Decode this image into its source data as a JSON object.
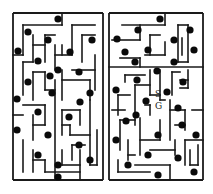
{
  "figure": {
    "colors": {
      "wall": "#1a1a1a",
      "dot": "#0a0a0a",
      "background": "#ffffff"
    }
  },
  "mazes": [
    {
      "id": "left",
      "bounds": [
        13,
        13,
        103,
        180
      ],
      "walls": [
        [
          13,
          13,
          103,
          13
        ],
        [
          103,
          13,
          103,
          180
        ],
        [
          13,
          180,
          103,
          180
        ],
        [
          13,
          13,
          13,
          180
        ],
        [
          23,
          25,
          62,
          25
        ],
        [
          62,
          25,
          62,
          13
        ],
        [
          23,
          25,
          23,
          55
        ],
        [
          13,
          55,
          23,
          55
        ],
        [
          33,
          35,
          33,
          62
        ],
        [
          33,
          45,
          45,
          45
        ],
        [
          45,
          35,
          45,
          62
        ],
        [
          45,
          35,
          55,
          35
        ],
        [
          55,
          45,
          55,
          70
        ],
        [
          55,
          55,
          72,
          55
        ],
        [
          72,
          25,
          72,
          55
        ],
        [
          72,
          25,
          95,
          25
        ],
        [
          82,
          35,
          82,
          62
        ],
        [
          82,
          35,
          95,
          35
        ],
        [
          62,
          45,
          62,
          55
        ],
        [
          23,
          62,
          33,
          62
        ],
        [
          23,
          62,
          23,
          95
        ],
        [
          33,
          72,
          33,
          100
        ],
        [
          33,
          72,
          45,
          72
        ],
        [
          45,
          72,
          45,
          90
        ],
        [
          45,
          90,
          55,
          90
        ],
        [
          55,
          80,
          55,
          180
        ],
        [
          62,
          70,
          62,
          100
        ],
        [
          62,
          80,
          90,
          80
        ],
        [
          90,
          80,
          90,
          100
        ],
        [
          72,
          70,
          95,
          70
        ],
        [
          95,
          55,
          95,
          90
        ],
        [
          23,
          105,
          45,
          105
        ],
        [
          45,
          105,
          45,
          125
        ],
        [
          13,
          115,
          23,
          115
        ],
        [
          33,
          115,
          33,
          140
        ],
        [
          33,
          125,
          45,
          125
        ],
        [
          62,
          110,
          80,
          110
        ],
        [
          80,
          110,
          80,
          125
        ],
        [
          62,
          110,
          62,
          135
        ],
        [
          62,
          125,
          70,
          125
        ],
        [
          70,
          125,
          70,
          135
        ],
        [
          70,
          135,
          90,
          135
        ],
        [
          90,
          100,
          90,
          165
        ],
        [
          90,
          165,
          97,
          165
        ],
        [
          97,
          130,
          97,
          165
        ],
        [
          72,
          145,
          72,
          160
        ],
        [
          72,
          145,
          85,
          145
        ],
        [
          23,
          140,
          23,
          172
        ],
        [
          33,
          150,
          33,
          172
        ],
        [
          33,
          160,
          45,
          160
        ],
        [
          45,
          160,
          45,
          172
        ],
        [
          45,
          172,
          80,
          172
        ],
        [
          62,
          150,
          62,
          165
        ],
        [
          62,
          165,
          80,
          165
        ],
        [
          80,
          150,
          80,
          180
        ]
      ],
      "dots": [
        [
          58,
          19
        ],
        [
          28,
          32
        ],
        [
          48,
          40
        ],
        [
          92,
          40
        ],
        [
          18,
          51
        ],
        [
          70,
          52
        ],
        [
          38,
          61
        ],
        [
          58,
          70
        ],
        [
          50,
          76
        ],
        [
          79,
          72
        ],
        [
          28,
          82
        ],
        [
          90,
          93
        ],
        [
          17,
          99
        ],
        [
          52,
          93
        ],
        [
          80,
          102
        ],
        [
          38,
          112
        ],
        [
          69,
          117
        ],
        [
          17,
          130
        ],
        [
          48,
          135
        ],
        [
          79,
          145
        ],
        [
          38,
          155
        ],
        [
          58,
          165
        ],
        [
          90,
          160
        ],
        [
          58,
          177
        ]
      ]
    },
    {
      "id": "right",
      "bounds": [
        109,
        13,
        203,
        180
      ],
      "walls": [
        [
          109,
          13,
          203,
          13
        ],
        [
          203,
          13,
          203,
          180
        ],
        [
          109,
          180,
          203,
          180
        ],
        [
          109,
          13,
          109,
          180
        ],
        [
          122,
          25,
          165,
          25
        ],
        [
          165,
          13,
          165,
          25
        ],
        [
          140,
          25,
          140,
          40
        ],
        [
          112,
          40,
          140,
          40
        ],
        [
          150,
          35,
          160,
          35
        ],
        [
          150,
          35,
          150,
          55
        ],
        [
          145,
          55,
          165,
          55
        ],
        [
          165,
          42,
          165,
          55
        ],
        [
          178,
          25,
          178,
          62
        ],
        [
          178,
          62,
          188,
          62
        ],
        [
          188,
          25,
          188,
          62
        ],
        [
          178,
          25,
          188,
          25
        ],
        [
          182,
          38,
          182,
          55
        ],
        [
          120,
          58,
          140,
          58
        ],
        [
          140,
          58,
          140,
          67
        ],
        [
          109,
          67,
          203,
          67
        ],
        [
          125,
          75,
          145,
          75
        ],
        [
          125,
          75,
          125,
          82
        ],
        [
          150,
          70,
          150,
          95
        ],
        [
          160,
          70,
          160,
          100
        ],
        [
          172,
          72,
          172,
          95
        ],
        [
          172,
          72,
          180,
          72
        ],
        [
          180,
          80,
          188,
          80
        ],
        [
          188,
          70,
          188,
          88
        ],
        [
          180,
          88,
          188,
          88
        ],
        [
          135,
          85,
          135,
          125
        ],
        [
          135,
          85,
          150,
          85
        ],
        [
          118,
          95,
          130,
          95
        ],
        [
          118,
          95,
          118,
          115
        ],
        [
          150,
          95,
          160,
          95
        ],
        [
          160,
          100,
          165,
          100
        ],
        [
          145,
          105,
          150,
          105
        ],
        [
          150,
          105,
          150,
          115
        ],
        [
          170,
          100,
          170,
          140
        ],
        [
          170,
          110,
          185,
          110
        ],
        [
          185,
          110,
          185,
          130
        ],
        [
          112,
          110,
          125,
          110
        ],
        [
          192,
          110,
          203,
          110
        ],
        [
          120,
          120,
          135,
          120
        ],
        [
          120,
          120,
          120,
          150
        ],
        [
          140,
          118,
          140,
          155
        ],
        [
          140,
          140,
          160,
          140
        ],
        [
          160,
          120,
          160,
          140
        ],
        [
          175,
          125,
          185,
          125
        ],
        [
          128,
          140,
          128,
          160
        ],
        [
          128,
          155,
          135,
          155
        ],
        [
          150,
          150,
          175,
          150
        ],
        [
          175,
          140,
          175,
          155
        ],
        [
          185,
          140,
          185,
          165
        ],
        [
          185,
          140,
          203,
          140
        ],
        [
          190,
          150,
          190,
          165
        ],
        [
          190,
          165,
          198,
          165
        ],
        [
          198,
          145,
          198,
          165
        ],
        [
          135,
          165,
          170,
          165
        ],
        [
          170,
          165,
          170,
          180
        ],
        [
          118,
          160,
          118,
          172
        ],
        [
          118,
          172,
          150,
          172
        ]
      ],
      "dots": [
        [
          160,
          19
        ],
        [
          138,
          30
        ],
        [
          117,
          39
        ],
        [
          174,
          40
        ],
        [
          148,
          50
        ],
        [
          190,
          30
        ],
        [
          125,
          52
        ],
        [
          194,
          50
        ],
        [
          135,
          62
        ],
        [
          174,
          62
        ],
        [
          157,
          71
        ],
        [
          183,
          82
        ],
        [
          137,
          80
        ],
        [
          116,
          90
        ],
        [
          167,
          92
        ],
        [
          146,
          101
        ],
        [
          136,
          115
        ],
        [
          178,
          108
        ],
        [
          126,
          121
        ],
        [
          182,
          125
        ],
        [
          158,
          135
        ],
        [
          196,
          135
        ],
        [
          116,
          140
        ],
        [
          148,
          155
        ],
        [
          178,
          158
        ],
        [
          194,
          172
        ],
        [
          128,
          165
        ],
        [
          158,
          175
        ]
      ],
      "markers": {
        "start": {
          "label": "S",
          "x": 158,
          "y": 94
        },
        "goal": {
          "label": "G",
          "x": 158,
          "y": 106
        }
      }
    }
  ]
}
